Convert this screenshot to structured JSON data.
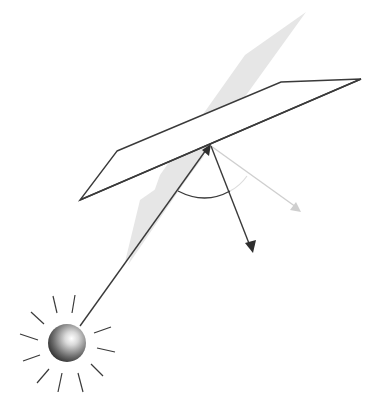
{
  "diagram": {
    "colors": {
      "background": "#ffffff",
      "line": "#3a3a3a",
      "plane_of_incidence": "#e3e3e3",
      "faint_ray": "#c8c8c8",
      "arrow_dark": "#333333"
    },
    "elements": {
      "light_source": "radiant sphere",
      "surface": "parallelogram plane",
      "plane_of_incidence": "gray shaded plane",
      "incident_ray": "ray from source to surface",
      "reflected_ray": "dark arrow",
      "faint_ray": "light gray arrow",
      "angle_arc": "arc between rays"
    }
  }
}
